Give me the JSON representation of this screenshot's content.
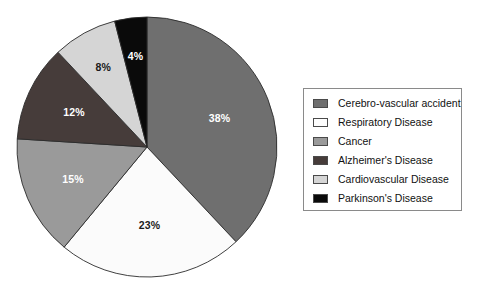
{
  "chart_data": {
    "type": "pie",
    "title": "",
    "subtitle": "",
    "xlabel": "",
    "ylabel": "",
    "legend_position": "right",
    "grid": false,
    "start_angle_deg": 0,
    "direction": "clockwise",
    "categories": [
      "Cerebro-vascular accident",
      "Respiratory Disease",
      "Cancer",
      "Alzheimer's Disease",
      "Cardiovascular Disease",
      "Parkinson's Disease"
    ],
    "values": [
      38,
      23,
      15,
      12,
      8,
      4
    ],
    "value_labels": [
      "38%",
      "23%",
      "15%",
      "12%",
      "8%",
      "4%"
    ],
    "colors": [
      "#6f6f6f",
      "#fbfbfb",
      "#9a9a9a",
      "#463c3a",
      "#d5d5d5",
      "#0a0a0a"
    ],
    "label_colors": [
      "#ffffff",
      "#1a1a1a",
      "#ffffff",
      "#ffffff",
      "#1a1a1a",
      "#ffffff"
    ],
    "slices": [
      {
        "label": "Cerebro-vascular accident",
        "value": 38,
        "value_label": "38%",
        "color": "#6f6f6f"
      },
      {
        "label": "Respiratory Disease",
        "value": 23,
        "value_label": "23%",
        "color": "#fbfbfb"
      },
      {
        "label": "Cancer",
        "value": 15,
        "value_label": "15%",
        "color": "#9a9a9a"
      },
      {
        "label": "Alzheimer's Disease",
        "value": 12,
        "value_label": "12%",
        "color": "#463c3a"
      },
      {
        "label": "Cardiovascular Disease",
        "value": 8,
        "value_label": "8%",
        "color": "#d5d5d5"
      },
      {
        "label": "Parkinson's Disease",
        "value": 4,
        "value_label": "4%",
        "color": "#0a0a0a"
      }
    ]
  },
  "legend": {
    "entries": [
      {
        "label": "Cerebro-vascular accident",
        "color": "#6f6f6f"
      },
      {
        "label": "Respiratory Disease",
        "color": "#fdfdfd"
      },
      {
        "label": "Cancer",
        "color": "#9a9a9a"
      },
      {
        "label": "Alzheimer's Disease",
        "color": "#463c3a"
      },
      {
        "label": "Cardiovascular Disease",
        "color": "#d5d5d5"
      },
      {
        "label": "Parkinson's Disease",
        "color": "#0a0a0a"
      }
    ]
  },
  "geometry": {
    "center_x": 147,
    "center_y": 147,
    "radius": 130
  }
}
